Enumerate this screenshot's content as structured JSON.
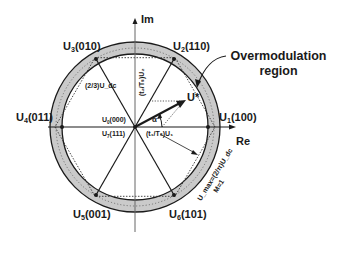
{
  "diagram": {
    "axes": {
      "imag_label": "Im",
      "real_label": "Re"
    },
    "vectors": [
      {
        "name": "U",
        "sub": "1",
        "state": "(100)",
        "angle_deg": 0
      },
      {
        "name": "U",
        "sub": "2",
        "state": "(110)",
        "angle_deg": 60
      },
      {
        "name": "U",
        "sub": "3",
        "state": "(010)",
        "angle_deg": 120
      },
      {
        "name": "U",
        "sub": "4",
        "state": "(011)",
        "angle_deg": 180
      },
      {
        "name": "U",
        "sub": "5",
        "state": "(001)",
        "angle_deg": 240
      },
      {
        "name": "U",
        "sub": "6",
        "state": "(101)",
        "angle_deg": 300
      }
    ],
    "zero_vectors": [
      {
        "name": "U",
        "sub": "0",
        "state": "(000)"
      },
      {
        "name": "U",
        "sub": "7",
        "state": "(111)"
      }
    ],
    "reference_vector": {
      "label": "U*",
      "angle_label": "α"
    },
    "component_labels": {
      "along_u1": "(t₁/Tₛ)U₁",
      "along_u2": "(t₂/Tₛ)U₂"
    },
    "hexagon_edge_label": "(2/3)U_dc",
    "max_circle_label": "U_max=(2/π)U_dc",
    "max_circle_sub_label": "M=1",
    "region_callout": {
      "line1": "Overmodulation",
      "line2": "region"
    },
    "colors": {
      "ring_fill": "#c8c8c8",
      "line": "#1a1a1a",
      "background": "#ffffff"
    }
  }
}
